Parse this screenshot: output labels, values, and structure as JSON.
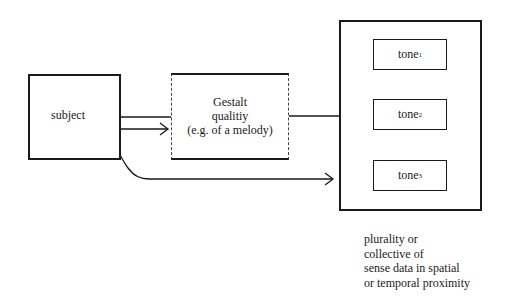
{
  "diagram": {
    "nodes": {
      "subject": {
        "label": "subject"
      },
      "gestalt": {
        "lines": [
          "Gestalt",
          "qualitiy",
          "(e.g. of a melody)"
        ]
      },
      "plurality": {
        "tones": [
          {
            "base": "tone",
            "index": "1"
          },
          {
            "base": "tone",
            "index": "2"
          },
          {
            "base": "tone",
            "index": "3"
          }
        ],
        "caption_lines": [
          "plurality or",
          "collective of",
          "sense data in spatial",
          "or temporal proximity"
        ]
      }
    },
    "edges": [
      {
        "from": "subject",
        "to": "gestalt",
        "style": "line"
      },
      {
        "from": "subject",
        "to": "gestalt",
        "style": "arrow"
      },
      {
        "from": "gestalt",
        "to": "plurality",
        "style": "line"
      },
      {
        "from": "subject",
        "to": "plurality",
        "style": "curved-arrow"
      }
    ],
    "colors": {
      "stroke": "#1a1a1a",
      "background": "#ffffff"
    }
  }
}
